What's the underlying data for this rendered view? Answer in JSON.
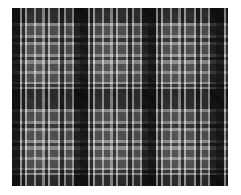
{
  "image": {
    "description": "Black, white and grey plaid (tartan) fabric texture",
    "colors": {
      "dark": "#0a0a0a",
      "mid": "#5a5a5a",
      "light": "#e6e6e6",
      "background": "#ffffff"
    }
  }
}
